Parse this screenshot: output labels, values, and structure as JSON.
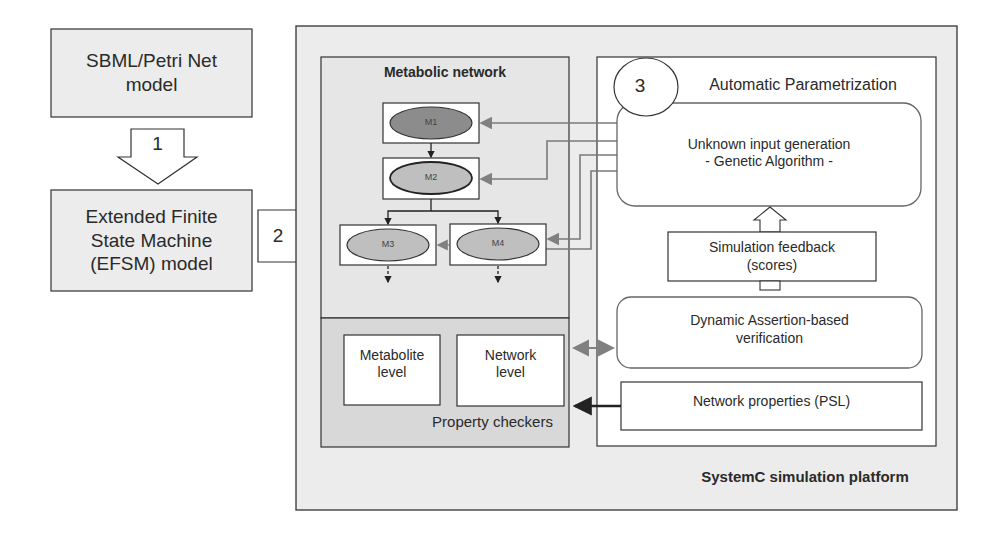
{
  "diagram": {
    "left_column": {
      "source_model": "SBML/Petri Net\nmodel",
      "step1_label": "1",
      "efsm_model": "Extended Finite\nState Machine\n(EFSM) model",
      "step2_label": "2"
    },
    "platform": {
      "title": "SystemC simulation platform",
      "metabolic_network": {
        "title": "Metabolic network",
        "nodes": [
          {
            "id": "M1",
            "label": "M1"
          },
          {
            "id": "M2",
            "label": "M2"
          },
          {
            "id": "M3",
            "label": "M3"
          },
          {
            "id": "M4",
            "label": "M4"
          }
        ]
      },
      "property_checkers": {
        "title": "Property checkers",
        "metabolite_level": "Metabolite\nlevel",
        "network_level": "Network\nlevel"
      },
      "automatic_parametrization": {
        "step3_label": "3",
        "title": "Automatic Parametrization",
        "unknown_input": "Unknown input generation\n- Genetic Algorithm -",
        "simulation_feedback": "Simulation feedback\n(scores)",
        "dynamic_verification": "Dynamic Assertion-based\nverification",
        "network_properties": "Network properties (PSL)"
      }
    },
    "colors": {
      "panel_fill": "#ececec",
      "checker_fill": "#d9d9d9",
      "m1_fill": "#8c8c8c",
      "node_fill": "#bfbfbf",
      "connector_gray": "#7a7a7a",
      "border": "#333333"
    }
  }
}
